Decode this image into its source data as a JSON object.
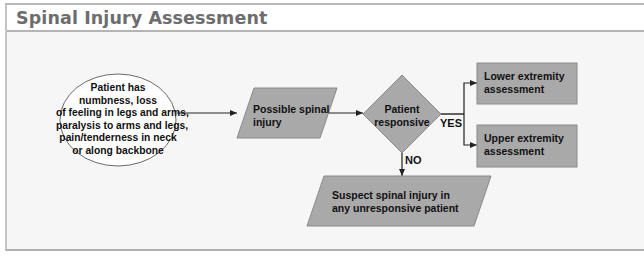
{
  "header": {
    "title": "Spinal Injury Assessment"
  },
  "colors": {
    "node_fill": "#a9a9a9",
    "node_stroke": "#888888",
    "ellipse_fill": "#ffffff",
    "arrow": "#222222",
    "background": "#f6f6f6",
    "title_color": "#6d6d6d"
  },
  "diagram": {
    "nodes": {
      "start": {
        "shape": "ellipse",
        "lines": [
          "Patient has",
          "numbness, loss",
          "of feeling in legs and arms,",
          "paralysis to arms and legs,",
          "pain/tenderness in neck",
          "or along backbone"
        ]
      },
      "possible": {
        "shape": "parallelogram",
        "lines": [
          "Possible spinal",
          "injury"
        ]
      },
      "decision": {
        "shape": "diamond",
        "lines": [
          "Patient",
          "responsive"
        ]
      },
      "lower": {
        "shape": "rectangle",
        "lines": [
          "Lower extremity",
          "assessment"
        ]
      },
      "upper": {
        "shape": "rectangle",
        "lines": [
          "Upper extremity",
          "assessment"
        ]
      },
      "suspect": {
        "shape": "parallelogram",
        "lines": [
          "Suspect spinal injury in",
          "any unresponsive patient"
        ]
      }
    },
    "edge_labels": {
      "yes": "YES",
      "no": "NO"
    }
  }
}
